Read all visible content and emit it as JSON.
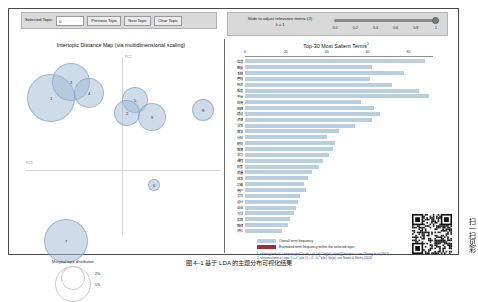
{
  "toolbar": {
    "selected_topic_label": "Selected Topic:",
    "selected_topic_value": "0",
    "previous_topic_button": "Previous Topic",
    "next_topic_button": "Next Topic",
    "clear_topic_button": "Clear Topic",
    "slider_label_line1": "Slide to adjust relevance metric:(2)",
    "slider_label_line2": "λ = 1",
    "slider_value": "1",
    "slider_ticks": [
      "0.0",
      "0.2",
      "0.4",
      "0.6",
      "0.8",
      "1"
    ]
  },
  "left_panel": {
    "title": "Intertopic Distance Map (via multidimensional scaling)",
    "axis_x_label": "PC1",
    "axis_y_label": "PC2",
    "legend_title": "Marginal topic distribution",
    "legend_sizes": [
      "2%",
      "5%",
      "9%"
    ]
  },
  "right_panel": {
    "title": "Top-30 Most Salient Terms",
    "title_superscript": "1",
    "x_ticks": [
      "0",
      "20",
      "40",
      "60",
      "80"
    ],
    "legend": [
      {
        "label": "Overall term frequency",
        "color": "#b9cfe0"
      },
      {
        "label": "Estimated term frequency within the selected topic",
        "color": "#9e2f35"
      }
    ],
    "footnotes": [
      "1. saliency(term w) = frequency(w) * [sum_t p(t | w) * log(p(t | w)/p(t))] for topics t; see Chuang et. al (2012)",
      "2. relevance(term w | topic t) = λ * p(w | t) + (1 - λ) * p(w | t)/p(w); see Sievert & Shirley (2014)"
    ]
  },
  "chart_data": {
    "type": "bar",
    "title": "Top-30 Most Salient Terms",
    "xlabel": "",
    "ylabel": "",
    "xlim": [
      0,
      92
    ],
    "grid": false,
    "legend_position": "bottom",
    "categories": [
      "信息",
      "数据",
      "系统",
      "管理",
      "技术",
      "服务",
      "平台",
      "应用",
      "网络",
      "建设",
      "资源",
      "学生",
      "教学",
      "分析",
      "研究",
      "教育",
      "学习",
      "课程",
      "模型",
      "质量",
      "体系",
      "功能",
      "用户",
      "工作",
      "设计",
      "企业",
      "方法",
      "实现",
      "教师",
      "评价"
    ],
    "series": [
      {
        "name": "Overall term frequency",
        "values": [
          88,
          62,
          78,
          61,
          72,
          85,
          90,
          57,
          63,
          66,
          62,
          54,
          46,
          40,
          44,
          43,
          41,
          38,
          36,
          33,
          31,
          29,
          30,
          27,
          26,
          25,
          24,
          22,
          21,
          18
        ]
      },
      {
        "name": "Estimated term frequency within the selected topic",
        "values": [
          0,
          0,
          0,
          0,
          0,
          0,
          0,
          0,
          0,
          0,
          0,
          0,
          0,
          0,
          0,
          0,
          0,
          0,
          0,
          0,
          0,
          0,
          0,
          0,
          0,
          0,
          0,
          0,
          0,
          0
        ]
      }
    ],
    "bubbles": [
      {
        "id": "1",
        "cx": 30,
        "cy": 47,
        "r": 24
      },
      {
        "id": "3",
        "cx": 50,
        "cy": 31,
        "r": 19
      },
      {
        "id": "4",
        "cx": 68,
        "cy": 42,
        "r": 15
      },
      {
        "id": "5",
        "cx": 114,
        "cy": 49,
        "r": 13
      },
      {
        "id": "2",
        "cx": 106,
        "cy": 62,
        "r": 13
      },
      {
        "id": "9",
        "cx": 131,
        "cy": 66,
        "r": 14
      },
      {
        "id": "8",
        "cx": 182,
        "cy": 59,
        "r": 11
      },
      {
        "id": "6",
        "cx": 133,
        "cy": 134,
        "r": 6
      },
      {
        "id": "7",
        "cx": 45,
        "cy": 190,
        "r": 22
      }
    ]
  },
  "caption": {
    "text": "图 4–1 基于 LDA 的主题分布可视化结果"
  },
  "qr": {
    "side_text": "扫一扫见彩"
  }
}
